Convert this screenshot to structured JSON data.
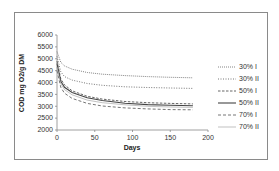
{
  "chart_data": {
    "type": "line",
    "title": "",
    "xlabel": "Days",
    "ylabel": "COD mg O2/g DM",
    "xlim": [
      0,
      200
    ],
    "ylim": [
      2000,
      6000
    ],
    "xticks": [
      0,
      50,
      100,
      150,
      200
    ],
    "yticks": [
      2000,
      2500,
      3000,
      3500,
      4000,
      4500,
      5000,
      5500,
      6000
    ],
    "grid": false,
    "legend_position": "right",
    "x": [
      0,
      5,
      10,
      20,
      40,
      60,
      90,
      120,
      150,
      180
    ],
    "series": [
      {
        "name": "30% I",
        "style": "dotted-dense",
        "values": [
          5300,
          4850,
          4700,
          4560,
          4420,
          4350,
          4290,
          4250,
          4220,
          4200
        ]
      },
      {
        "name": "30% II",
        "style": "dotted",
        "values": [
          5100,
          4450,
          4250,
          4100,
          3960,
          3880,
          3820,
          3790,
          3770,
          3750
        ]
      },
      {
        "name": "50% I",
        "style": "dashed",
        "values": [
          4900,
          4150,
          3900,
          3650,
          3420,
          3300,
          3200,
          3150,
          3120,
          3100
        ]
      },
      {
        "name": "50% II",
        "style": "solid",
        "values": [
          4800,
          4050,
          3800,
          3580,
          3360,
          3240,
          3130,
          3070,
          3040,
          3020
        ]
      },
      {
        "name": "70% I",
        "style": "dash-long",
        "values": [
          4500,
          3800,
          3550,
          3330,
          3120,
          3010,
          2930,
          2890,
          2860,
          2850
        ]
      },
      {
        "name": "70% II",
        "style": "thin-solid",
        "values": [
          4650,
          3950,
          3700,
          3480,
          3260,
          3150,
          3060,
          3000,
          2970,
          2950
        ]
      }
    ]
  },
  "axes": {
    "xlabel": "Days",
    "ylabel": "COD mg O2/g DM",
    "xticks": [
      "0",
      "50",
      "100",
      "150",
      "200"
    ],
    "yticks": [
      "6000",
      "5500",
      "5000",
      "4500",
      "4000",
      "3500",
      "3000",
      "2500",
      "2000"
    ]
  },
  "legend": [
    "30% I",
    "30% II",
    "50% I",
    "50% II",
    "70% I",
    "70% II"
  ]
}
